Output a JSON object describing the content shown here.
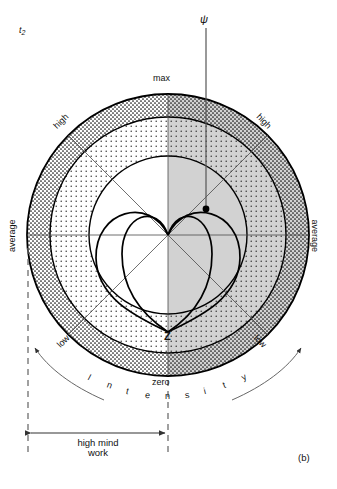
{
  "figure": {
    "panel_label": "(b)",
    "time_label": "t",
    "time_subscript": "2",
    "axis_symbol": "ψ",
    "center_marker": "Z"
  },
  "ring_labels": {
    "max": "max",
    "zero": "zero",
    "high_left": "high",
    "high_right": "high",
    "average_left": "average",
    "average_right": "average",
    "low_left": "low",
    "low_right": "low"
  },
  "arc_caption": {
    "full": "Intensity",
    "letters": [
      "I",
      "n",
      "t",
      "e",
      "n",
      "s",
      "i",
      "t",
      "y"
    ]
  },
  "measure": {
    "line1": "high mind",
    "line2": "work"
  },
  "colors": {
    "stroke": "#000000",
    "shade_right": "#d2d2d2",
    "dot_fill": "#000000",
    "background": "#ffffff",
    "thin_line": "#555555",
    "dash_line": "#777777"
  },
  "chart_data": {
    "type": "polar",
    "title": "Intensity",
    "center": [
      168,
      235
    ],
    "rings": [
      {
        "name": "zero/max outer",
        "radius": 141,
        "label_top": "max",
        "label_bottom": "zero"
      },
      {
        "name": "average",
        "radius": 118,
        "label_left": "average",
        "label_right": "average"
      },
      {
        "name": "high/low inner",
        "radius": 79,
        "label": "high"
      }
    ],
    "scale_labels": [
      "max",
      "high",
      "average",
      "low",
      "zero"
    ],
    "spoke_angles_deg": [
      0,
      45,
      90,
      135,
      180,
      225,
      270,
      315
    ],
    "shaded_half": "right",
    "curves": [
      {
        "name": "cardioid-left",
        "orientation": "down",
        "apex": "center",
        "tip": "Z"
      },
      {
        "name": "cardioid-right",
        "orientation": "down",
        "apex": "center",
        "tip": "Z"
      }
    ],
    "point_marker": {
      "label": "ψ",
      "x": 206,
      "y": 209
    },
    "axis_ray": {
      "from": [
        206,
        209
      ],
      "to": [
        206,
        30
      ],
      "label": "ψ"
    }
  }
}
